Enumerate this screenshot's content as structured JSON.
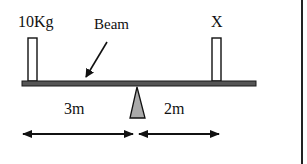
{
  "diagram": {
    "labels": {
      "left_mass": "10Kg",
      "beam": "Beam",
      "right_mass": "X",
      "left_distance": "3m",
      "right_distance": "2m"
    },
    "colors": {
      "beam": "#555555",
      "beam_stroke": "#1a1a1a",
      "fulcrum": "#aaaaaa",
      "outline": "#111111",
      "block_fill": "#ffffff",
      "border": "#222222"
    },
    "elements": {
      "beam": {
        "x": 22,
        "y": 81,
        "width": 234,
        "height": 5
      },
      "left_block": {
        "x": 28,
        "y": 38,
        "width": 9,
        "height": 43
      },
      "right_block": {
        "x": 212,
        "y": 38,
        "width": 9,
        "height": 43
      },
      "fulcrum": {
        "apex_x": 137,
        "apex_y": 87,
        "base_left": 130,
        "base_right": 145,
        "base_y": 118
      },
      "left_dimension": {
        "x1": 22,
        "x2": 133,
        "y": 134
      },
      "right_dimension": {
        "x1": 138,
        "x2": 220,
        "y": 134
      }
    }
  }
}
